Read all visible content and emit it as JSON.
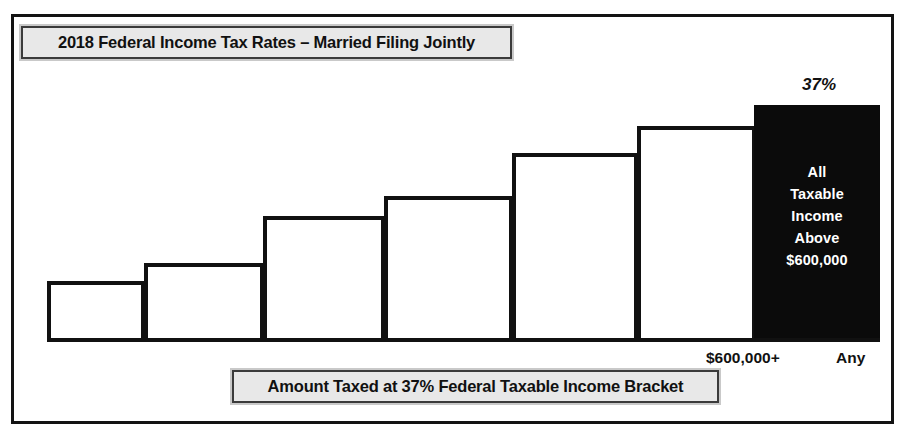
{
  "figure": {
    "title": "2018 Federal Income Tax Rates – Married Filing Jointly",
    "caption": "Amount Taxed at 37% Federal Taxable Income Bracket",
    "frame_color": "#131313",
    "plate_fill": "#e8e8e8",
    "plate_border": "#3b3b3b",
    "bar_outline_color": "#111111",
    "highlight_fill": "#0b0b0b",
    "highlight_text_color": "#ffffff"
  },
  "highlight": {
    "rate_label": "37%",
    "inner_lines": [
      "All",
      "Taxable",
      "Income",
      "Above",
      "$600,000"
    ]
  },
  "axis": {
    "ticks": [
      {
        "name": "threshold",
        "label": "$600,000+"
      },
      {
        "name": "any",
        "label": "Any"
      }
    ]
  },
  "chart_data": {
    "type": "bar",
    "title": "2018 Federal Income Tax Rates – Married Filing Jointly",
    "subtitle": "Amount Taxed at 37% Federal Taxable Income Bracket",
    "xlabel": "",
    "ylabel": "",
    "grid": false,
    "legend": "none",
    "categories": [
      "10%",
      "12%",
      "22%",
      "24%",
      "32%",
      "35%",
      "37%"
    ],
    "values": [
      10,
      12,
      22,
      24,
      32,
      35,
      37
    ],
    "annotations": [
      {
        "target": "37%",
        "text": "37%",
        "position": "above-bar",
        "style": "bold-italic"
      },
      {
        "target": "37%",
        "text": "All Taxable Income Above $600,000",
        "position": "inside-bar",
        "style": "white-bold"
      }
    ],
    "tick_labels": [
      "$600,000+",
      "Any"
    ],
    "highlight_category": "37%",
    "bars_px": [
      {
        "name": "bar-1",
        "left": 33,
        "top": 264,
        "width": 98,
        "height": 61,
        "filled": false
      },
      {
        "name": "bar-2",
        "left": 130,
        "top": 246,
        "width": 120,
        "height": 79,
        "filled": false
      },
      {
        "name": "bar-3",
        "left": 249,
        "top": 199,
        "width": 122,
        "height": 126,
        "filled": false
      },
      {
        "name": "bar-4",
        "left": 370,
        "top": 179,
        "width": 129,
        "height": 146,
        "filled": false
      },
      {
        "name": "bar-5",
        "left": 498,
        "top": 136,
        "width": 126,
        "height": 189,
        "filled": false
      },
      {
        "name": "bar-6",
        "left": 623,
        "top": 109,
        "width": 119,
        "height": 216,
        "filled": false
      },
      {
        "name": "bar-7",
        "left": 740,
        "top": 88,
        "width": 126,
        "height": 237,
        "filled": true
      }
    ]
  }
}
